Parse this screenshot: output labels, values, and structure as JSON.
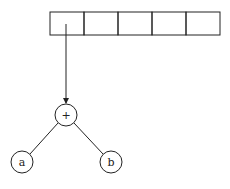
{
  "diagram": {
    "array": {
      "cell_count": 5,
      "cells": [
        "",
        "",
        "",
        "",
        ""
      ]
    },
    "nodes": {
      "root": {
        "label": "+"
      },
      "left": {
        "label": "a"
      },
      "right": {
        "label": "b"
      }
    },
    "stroke_color": "#222222"
  }
}
